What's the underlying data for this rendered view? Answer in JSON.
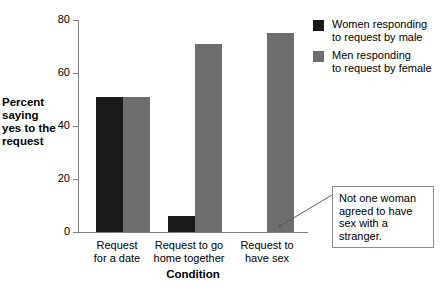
{
  "chart_data": {
    "type": "bar",
    "title": "",
    "xlabel": "Condition",
    "ylabel": "Percent saying yes to the request",
    "categories": [
      "Request\nfor a date",
      "Request to go\nhome together",
      "Request to\nhave sex"
    ],
    "category_lines": [
      [
        "Request",
        "for a date"
      ],
      [
        "Request to go",
        "home together"
      ],
      [
        "Request to",
        "have sex"
      ]
    ],
    "series": [
      {
        "name": "Women responding to request by male",
        "color": "#1a1a1a",
        "values": [
          51,
          6,
          0
        ]
      },
      {
        "name": "Men responding to request by female",
        "color": "#6e6e6e",
        "values": [
          51,
          71,
          75
        ]
      }
    ],
    "ylim": [
      0,
      80
    ],
    "yticks": [
      0,
      20,
      40,
      60,
      80
    ],
    "ytick_labels": [
      "0",
      "20",
      "40",
      "60",
      "80"
    ],
    "grid": false,
    "legend_position": "top-right",
    "annotations": [
      {
        "text": "Not one woman agreed to have sex with a stranger.",
        "lines": [
          "Not one woman",
          "agreed to have",
          "sex with a stranger."
        ],
        "points_to": "women-request-to-have-sex-zero-bar"
      }
    ]
  },
  "legend": {
    "items": [
      {
        "label_lines": [
          "Women responding",
          "to request by male"
        ],
        "line1": "Women responding",
        "line2": "to request by male",
        "color": "#1a1a1a"
      },
      {
        "label_lines": [
          "Men responding",
          "to request by female"
        ],
        "line1": "Men responding",
        "line2": "to request by female",
        "color": "#6e6e6e"
      }
    ]
  },
  "axes": {
    "y_title_line1": "Percent",
    "y_title_line2": "saying",
    "y_title_line3": "yes to the",
    "y_title_line4": "request",
    "x_title": "Condition",
    "ytick_0": "0",
    "ytick_20": "20",
    "ytick_40": "40",
    "ytick_60": "60",
    "ytick_80": "80"
  },
  "categories_text": {
    "c0_l1": "Request",
    "c0_l2": "for a date",
    "c1_l1": "Request to go",
    "c1_l2": "home together",
    "c2_l1": "Request to",
    "c2_l2": "have sex"
  },
  "annotation": {
    "line1": "Not one woman",
    "line2": "agreed to have",
    "line3": "sex with a stranger."
  },
  "colors": {
    "women_bar": "#1a1a1a",
    "men_bar": "#6e6e6e",
    "axis": "#808080",
    "annotation_border": "#8c8c8c",
    "background": "#ffffff"
  }
}
